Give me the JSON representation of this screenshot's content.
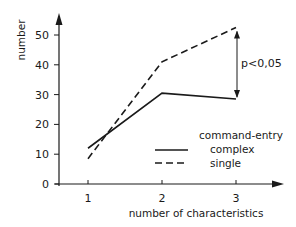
{
  "chart_data": {
    "type": "line",
    "title": "",
    "xlabel": "number of characteristics",
    "ylabel": "number",
    "x": [
      1,
      2,
      3
    ],
    "x_tick_labels": [
      "1",
      "2",
      "3"
    ],
    "y_ticks": [
      0,
      10,
      20,
      30,
      40,
      50
    ],
    "y_tick_labels": [
      "0",
      "10",
      "20",
      "30",
      "40",
      "50"
    ],
    "ylim": [
      0,
      55
    ],
    "xlim": [
      0.6,
      3.6
    ],
    "grid": false,
    "legend_title": "command-entry",
    "legend_position": "lower right",
    "series": [
      {
        "name": "complex",
        "style": "solid",
        "values": [
          12,
          30.5,
          28.5
        ]
      },
      {
        "name": "single",
        "style": "dashed",
        "values": [
          8.5,
          41,
          52.5
        ]
      }
    ],
    "annotations": [
      {
        "text": "p<0,05",
        "type": "double-arrow",
        "x": 3,
        "y_from": 28.5,
        "y_to": 52.5
      }
    ]
  },
  "colors": {
    "ink": "#1a1a1a",
    "background": "#ffffff"
  }
}
